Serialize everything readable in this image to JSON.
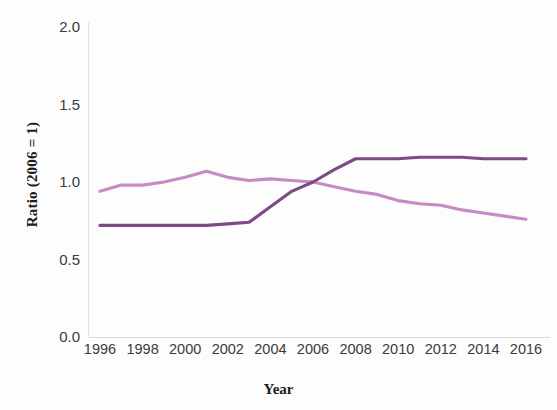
{
  "chart_data": {
    "type": "line",
    "title": "",
    "xlabel": "Year",
    "ylabel": "Ratio (2006 = 1)",
    "xlim": [
      1996,
      2016
    ],
    "ylim": [
      0.0,
      2.0
    ],
    "grid": false,
    "legend_position": "none",
    "x": [
      1996,
      1997,
      1998,
      1999,
      2000,
      2001,
      2002,
      2003,
      2004,
      2005,
      2006,
      2007,
      2008,
      2009,
      2010,
      2011,
      2012,
      2013,
      2014,
      2015,
      2016
    ],
    "xticks": [
      1996,
      1998,
      2000,
      2002,
      2004,
      2006,
      2008,
      2010,
      2012,
      2014,
      2016
    ],
    "xtick_labels": [
      "1996",
      "1998",
      "2000",
      "2002",
      "2004",
      "2006",
      "2008",
      "2010",
      "2012",
      "2014",
      "2016"
    ],
    "yticks": [
      0.0,
      0.5,
      1.0,
      1.5,
      2.0
    ],
    "ytick_labels": [
      "0.0",
      "0.5",
      "1.0",
      "1.5",
      "2.0"
    ],
    "series": [
      {
        "name": "series-light",
        "color": "#c78ac4",
        "values": [
          0.94,
          0.98,
          0.98,
          1.0,
          1.03,
          1.07,
          1.03,
          1.01,
          1.02,
          1.01,
          1.0,
          0.97,
          0.94,
          0.92,
          0.88,
          0.86,
          0.85,
          0.82,
          0.8,
          0.78,
          0.76
        ]
      },
      {
        "name": "series-dark",
        "color": "#7d4a86",
        "values": [
          0.72,
          0.72,
          0.72,
          0.72,
          0.72,
          0.72,
          0.73,
          0.74,
          0.84,
          0.94,
          1.0,
          1.08,
          1.15,
          1.15,
          1.15,
          1.16,
          1.16,
          1.16,
          1.15,
          1.15,
          1.15
        ]
      }
    ]
  }
}
